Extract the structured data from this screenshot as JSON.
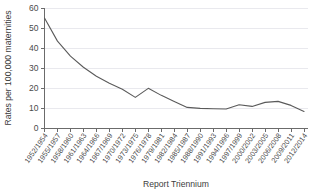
{
  "chart_data": {
    "type": "line",
    "title": "",
    "xlabel": "Report Triennium",
    "ylabel": "Rates per 100,000 maternities",
    "ylim": [
      0,
      60
    ],
    "yticks": [
      0,
      10,
      20,
      30,
      40,
      50,
      60
    ],
    "ytick_labels": [
      "0",
      "10",
      "20",
      "30",
      "40",
      "50",
      "60"
    ],
    "grid": true,
    "legend": null,
    "categories": [
      "1952/1954",
      "1955/1957",
      "1958/1960",
      "1961/1963",
      "1964/1966",
      "1967/1969",
      "1970/1972",
      "1973/1975",
      "1976/1978",
      "1979/1981",
      "1982/1984",
      "1985/1987",
      "1988/1990",
      "1991/1993",
      "1994/1996",
      "1997/1999",
      "2000/2002",
      "2003/2005",
      "2006/2008",
      "2009/2011",
      "2012/2014"
    ],
    "values": [
      55.0,
      43.5,
      36.0,
      30.5,
      26.0,
      22.5,
      19.5,
      15.5,
      20.0,
      16.5,
      13.5,
      10.5,
      10.0,
      9.8,
      9.7,
      11.8,
      11.0,
      13.0,
      13.5,
      11.5,
      8.5
    ],
    "series_name": "Maternal mortality rate"
  }
}
